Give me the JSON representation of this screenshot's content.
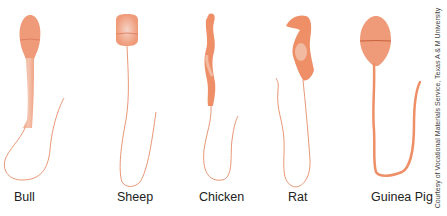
{
  "figure": {
    "colors": {
      "cell_fill": "#ef9a78",
      "cell_dark": "#e57a55",
      "highlight": "#f3c7b6",
      "tail_stroke": "#e58a68"
    },
    "specimens": [
      {
        "id": "bull",
        "label": "Bull"
      },
      {
        "id": "sheep",
        "label": "Sheep"
      },
      {
        "id": "chicken",
        "label": "Chicken"
      },
      {
        "id": "rat",
        "label": "Rat"
      },
      {
        "id": "guinea-pig",
        "label": "Guinea Pig"
      }
    ],
    "credit": "Courtesy of Vocational Materials Service, Texas A & M University"
  }
}
